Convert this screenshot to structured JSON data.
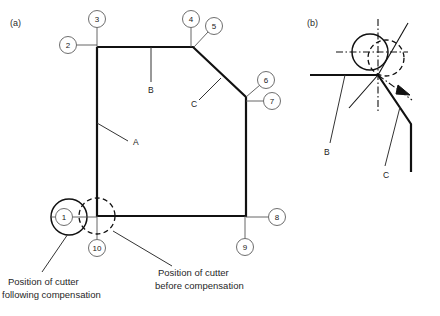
{
  "figure": {
    "panels": [
      {
        "tag": "(a)",
        "x": 10,
        "y": 26
      },
      {
        "tag": "(b)",
        "x": 307,
        "y": 26
      }
    ]
  },
  "panel_a": {
    "profile_points": "97,47 193,47 246,97 246,216 97,216 97,47",
    "balloons": [
      {
        "id": "1",
        "label": "1",
        "cx": 64,
        "cy": 217
      },
      {
        "id": "2",
        "label": "2",
        "cx": 68,
        "cy": 45
      },
      {
        "id": "3",
        "label": "3",
        "cx": 97,
        "cy": 19
      },
      {
        "id": "4",
        "label": "4",
        "cx": 191,
        "cy": 19
      },
      {
        "id": "5",
        "label": "5",
        "cx": 214,
        "cy": 26
      },
      {
        "id": "6",
        "label": "6",
        "cx": 266,
        "cy": 80
      },
      {
        "id": "7",
        "label": "7",
        "cx": 272,
        "cy": 101
      },
      {
        "id": "8",
        "label": "8",
        "cx": 277,
        "cy": 217
      },
      {
        "id": "9",
        "label": "9",
        "cx": 245,
        "cy": 247
      },
      {
        "id": "10",
        "label": "10",
        "cx": 97,
        "cy": 248
      }
    ],
    "feature_labels": [
      {
        "label": "A",
        "x": 133,
        "y": 145
      },
      {
        "label": "B",
        "x": 148,
        "y": 93
      },
      {
        "label": "C",
        "x": 191,
        "y": 107
      }
    ],
    "cutter_solid": {
      "cx": 69,
      "cy": 217,
      "r": 18
    },
    "cutter_dashed": {
      "cx": 97,
      "cy": 216,
      "r": 18
    },
    "captions": [
      {
        "id": "caption-following",
        "line1": "Position of cutter",
        "line2": "following compensation",
        "x": 8,
        "y": 285
      },
      {
        "id": "caption-before",
        "line1": "Position of cutter",
        "line2": "before compensation",
        "x": 158,
        "y": 275
      }
    ]
  },
  "panel_b": {
    "node": {
      "x": 378,
      "y": 75
    },
    "cutter_solid": {
      "cx": 370,
      "cy": 52,
      "r": 18
    },
    "cutter_dashed": {
      "cx": 386,
      "cy": 58,
      "r": 18
    },
    "feature_labels": [
      {
        "label": "B",
        "x": 327,
        "y": 152
      },
      {
        "label": "C",
        "x": 387,
        "y": 175
      }
    ]
  },
  "colors": {
    "ink": "#111111",
    "balloon_stroke": "#6e6e6e",
    "leader": "#333333",
    "background": "#ffffff"
  }
}
